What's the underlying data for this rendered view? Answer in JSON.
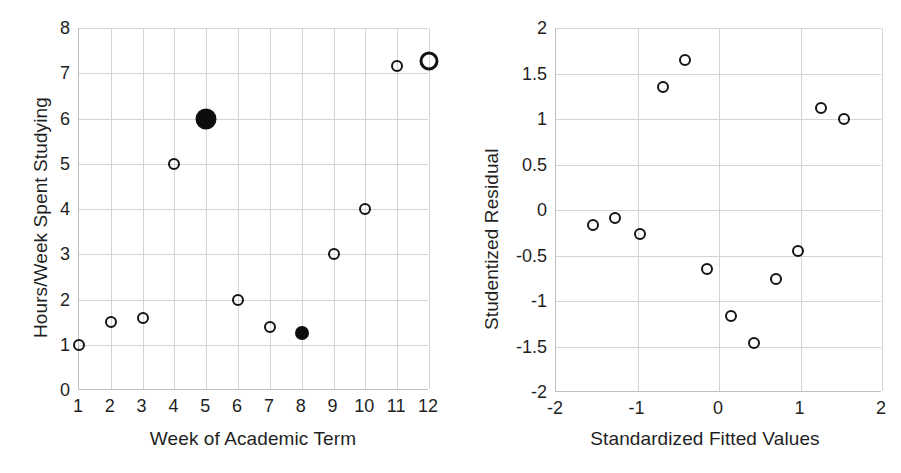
{
  "figure": {
    "panels": [
      {
        "id": "scatter-hours-vs-week",
        "xlabel": "Week of Academic Term",
        "ylabel": "Hours/Week Spent Studying"
      },
      {
        "id": "residual-plot",
        "xlabel": "Standardized Fitted Values",
        "ylabel": "Studentized Residual"
      }
    ]
  },
  "chart_data": [
    {
      "type": "scatter",
      "id": "scatter-hours-vs-week",
      "title": "",
      "xlabel": "Week of Academic Term",
      "ylabel": "Hours/Week Spent Studying",
      "xlim": [
        1,
        12
      ],
      "ylim": [
        0,
        8
      ],
      "xticks": [
        1,
        2,
        3,
        4,
        5,
        6,
        7,
        8,
        9,
        10,
        11,
        12
      ],
      "xticklabels": [
        "1",
        "2",
        "3",
        "4",
        "5",
        "6",
        "7",
        "8",
        "9",
        "10",
        "11",
        "12"
      ],
      "yticks": [
        0,
        1,
        2,
        3,
        4,
        5,
        6,
        7,
        8
      ],
      "yticklabels": [
        "0",
        "1",
        "2",
        "3",
        "4",
        "5",
        "6",
        "7",
        "8"
      ],
      "grid": true,
      "legend": "none",
      "x": [
        1,
        2,
        3,
        4,
        5,
        6,
        7,
        8,
        9,
        10,
        11,
        12
      ],
      "y": [
        1.0,
        1.5,
        1.6,
        5.0,
        6.0,
        2.0,
        1.4,
        1.25,
        3.0,
        4.0,
        7.17,
        7.27
      ],
      "points": [
        {
          "x": 1,
          "y": 1.0,
          "style": "open",
          "size": 12
        },
        {
          "x": 2,
          "y": 1.5,
          "style": "open",
          "size": 12
        },
        {
          "x": 3,
          "y": 1.6,
          "style": "open",
          "size": 12
        },
        {
          "x": 4,
          "y": 5.0,
          "style": "open",
          "size": 12
        },
        {
          "x": 5,
          "y": 6.0,
          "style": "filled",
          "size": 21
        },
        {
          "x": 6,
          "y": 2.0,
          "style": "open",
          "size": 12
        },
        {
          "x": 7,
          "y": 1.4,
          "style": "open",
          "size": 12
        },
        {
          "x": 8,
          "y": 1.25,
          "style": "filled",
          "size": 14
        },
        {
          "x": 9,
          "y": 3.0,
          "style": "open",
          "size": 12
        },
        {
          "x": 10,
          "y": 4.0,
          "style": "open",
          "size": 12
        },
        {
          "x": 11,
          "y": 7.17,
          "style": "open",
          "size": 12
        },
        {
          "x": 12,
          "y": 7.27,
          "style": "open-thick",
          "size": 19
        }
      ]
    },
    {
      "type": "scatter",
      "id": "residual-plot",
      "title": "",
      "xlabel": "Standardized Fitted Values",
      "ylabel": "Studentized Residual",
      "xlim": [
        -2,
        2
      ],
      "ylim": [
        -2,
        2
      ],
      "xticks": [
        -2,
        -1,
        0,
        1,
        2
      ],
      "xticklabels": [
        "-2",
        "-1",
        "0",
        "1",
        "2"
      ],
      "yticks": [
        -2,
        -1.5,
        -1,
        -0.5,
        0,
        0.5,
        1,
        1.5,
        2
      ],
      "yticklabels": [
        "-2",
        "-1.5",
        "-1",
        "-0.5",
        "0",
        "0.5",
        "1",
        "1.5",
        "2"
      ],
      "grid": true,
      "legend": "none",
      "x": [
        -1.55,
        -1.27,
        -0.97,
        -0.69,
        -0.42,
        -0.15,
        0.15,
        0.43,
        0.7,
        0.97,
        1.25,
        1.53
      ],
      "y": [
        -0.17,
        -0.09,
        -0.26,
        1.35,
        1.65,
        -0.65,
        -1.16,
        -1.46,
        -0.76,
        -0.45,
        1.12,
        1.0
      ],
      "points": [
        {
          "x": -1.55,
          "y": -0.17,
          "style": "open",
          "size": 12
        },
        {
          "x": -1.27,
          "y": -0.09,
          "style": "open",
          "size": 12
        },
        {
          "x": -0.97,
          "y": -0.26,
          "style": "open",
          "size": 12
        },
        {
          "x": -0.69,
          "y": 1.35,
          "style": "open",
          "size": 12
        },
        {
          "x": -0.42,
          "y": 1.65,
          "style": "open",
          "size": 12
        },
        {
          "x": -0.15,
          "y": -0.65,
          "style": "open",
          "size": 12
        },
        {
          "x": 0.15,
          "y": -1.16,
          "style": "open",
          "size": 12
        },
        {
          "x": 0.43,
          "y": -1.46,
          "style": "open",
          "size": 12
        },
        {
          "x": 0.7,
          "y": -0.76,
          "style": "open",
          "size": 12
        },
        {
          "x": 0.97,
          "y": -0.45,
          "style": "open",
          "size": 12
        },
        {
          "x": 1.25,
          "y": 1.12,
          "style": "open",
          "size": 12
        },
        {
          "x": 1.53,
          "y": 1.0,
          "style": "open",
          "size": 12
        }
      ]
    }
  ],
  "colors": {
    "marker_stroke": "#141414",
    "marker_fill": "#0d0d0d",
    "gridline": "#d4d4d4",
    "axis": "#bfbfbf",
    "text": "#1f1f1f",
    "background": "#ffffff"
  }
}
